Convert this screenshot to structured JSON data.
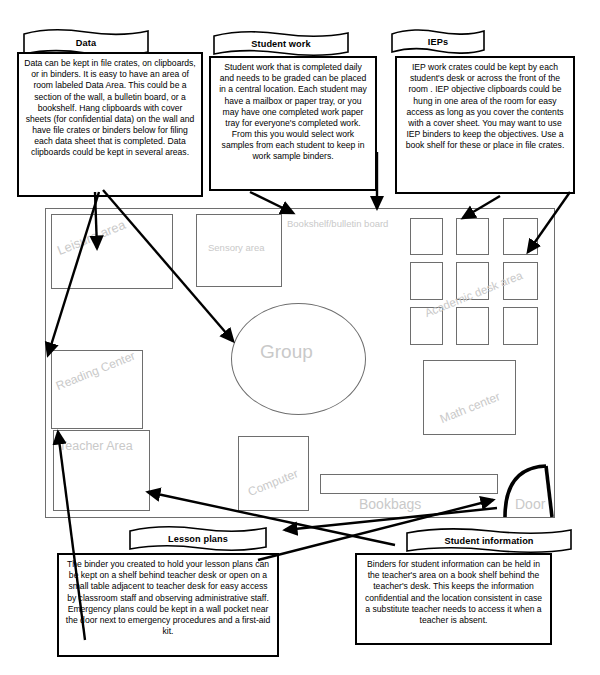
{
  "callouts": [
    {
      "id": "data",
      "banner": "Data",
      "text": "Data can be kept in file crates, on clipboards, or in binders.  It is easy to have an area of room labeled Data Area.  This could be a section of the wall, a bulletin board, or a bookshelf.  Hang clipboards with cover sheets (for confidential data) on the wall and have file crates or binders below for filing each data sheet that is completed. Data clipboards could  be kept in several areas."
    },
    {
      "id": "student-work",
      "banner": "Student work",
      "text": "Student work that is completed daily and needs to be graded can be placed in a central location. Each student may have a mailbox or paper tray, or you may have one completed work paper tray for everyone's completed work. From this you would select work samples from each student to keep in work sample binders."
    },
    {
      "id": "ieps",
      "banner": "IEPs",
      "text": "IEP work crates could be kept by each student's desk  or across the front of the room . IEP objective clipboards could be hung in one area  of the room for easy access as long as you cover the contents with a cover sheet.  You may want to use IEP binders to keep the objectives. Use a book shelf for these or place  in file crates."
    },
    {
      "id": "lesson-plans",
      "banner": "Lesson plans",
      "text": "The binder you created to hold your lesson plans can be kept on a shelf behind teacher desk or open on a small table adjacent to teacher desk for easy access by classroom staff and observing administrative staff. Emergency plans could be kept in a wall pocket near the door next to emergency procedures and a first-aid kit."
    },
    {
      "id": "student-information",
      "banner": "Student information",
      "text": "Binders for student information can be held in the teacher's area on a book shelf behind the teacher's desk. This keeps the information confidential and the location consistent in case a substitute teacher needs to access it when a teacher is absent."
    }
  ],
  "room": {
    "zones": [
      {
        "id": "leisure-area",
        "label": "Leisure area"
      },
      {
        "id": "sensory-area",
        "label": "Sensory area"
      },
      {
        "id": "bookshelf",
        "label": "Bookshelf/bulletin board"
      },
      {
        "id": "reading-center",
        "label": "Reading Center"
      },
      {
        "id": "group",
        "label": "Group"
      },
      {
        "id": "academic-desks",
        "label": "Academic desk area"
      },
      {
        "id": "math-center",
        "label": "Math center"
      },
      {
        "id": "teacher-area",
        "label": "Teacher Area"
      },
      {
        "id": "computer",
        "label": "Computer"
      },
      {
        "id": "bookbags",
        "label": "Bookbags"
      },
      {
        "id": "door",
        "label": "Door"
      }
    ],
    "desk_count": 9
  },
  "colors": {
    "zone_label": "#c9c9c9",
    "zone_stroke": "#6e6e6e",
    "callout_stroke": "#000000",
    "arrow": "#000000",
    "background": "#ffffff"
  }
}
